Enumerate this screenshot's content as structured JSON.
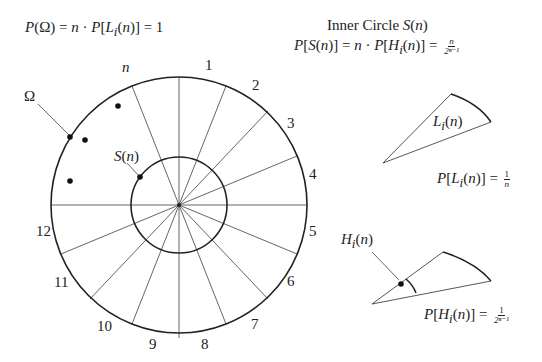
{
  "top_left_formula": "P(Ω) = n · P[L_i(n)] = 1",
  "top_left_formula_parts": {
    "lhs": "P(Ω) = ",
    "mid": "n",
    "rhs": " · P[L",
    "sub": "i",
    "tail": "(n)] = 1"
  },
  "inner_circle_title": "Inner Circle S(n)",
  "inner_circle_title_parts": {
    "text": "Inner Circle ",
    "sym": "S(n)"
  },
  "inner_circle_formula": "P[S(n)] = n · P[H_i(n)] = n / 2^(n-1)",
  "inner_circle_formula_parts": {
    "a": "P[S(n)] = n · P[H",
    "sub": "i",
    "b": "(n)] = ",
    "num": "n",
    "den": "2ⁿ⁻¹"
  },
  "circle": {
    "omega_label": "Ω",
    "s_label": "S(n)",
    "sector_labels": [
      "n",
      "1",
      "2",
      "3",
      "4",
      "5",
      "6",
      "7",
      "8",
      "9",
      "10",
      "11",
      "12"
    ]
  },
  "wedge_L": {
    "label": "L_i(n)",
    "label_parts": {
      "a": "L",
      "sub": "i",
      "b": "(n)"
    },
    "prob_parts": {
      "a": "P[L",
      "sub": "i",
      "b": "(n)] = ",
      "num": "1",
      "den": "n"
    },
    "prob": "P[L_i(n)] = 1/n"
  },
  "wedge_H": {
    "label": "H_i(n)",
    "label_parts": {
      "a": "H",
      "sub": "i",
      "b": "(n)"
    },
    "prob_parts": {
      "a": "P[H",
      "sub": "i",
      "b": "(n)] = ",
      "num": "1",
      "den": "2ⁿ⁻¹"
    },
    "prob": "P[H_i(n)] = 1/2^(n-1)"
  },
  "colors": {
    "stroke": "#222222",
    "spoke": "#555555",
    "background": "#ffffff"
  }
}
